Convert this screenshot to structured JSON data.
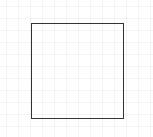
{
  "canvas": {
    "width": 153,
    "height": 137,
    "background_color": "#ffffff",
    "grid": {
      "visible": true,
      "spacing_px": 12,
      "color": "#f0f0f0"
    }
  },
  "shapes": [
    {
      "type": "rectangle",
      "name": "square",
      "x": 31,
      "y": 23,
      "width": 93,
      "height": 96,
      "stroke_color": "#333333",
      "fill": "none"
    }
  ]
}
